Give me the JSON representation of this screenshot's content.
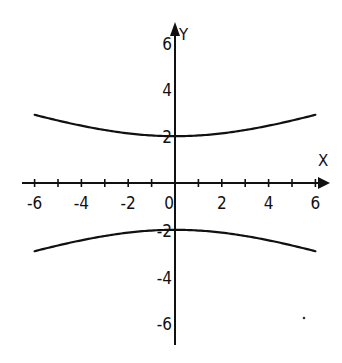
{
  "chart_data": {
    "type": "line",
    "title": "",
    "xlabel": "X",
    "ylabel": "Y",
    "xlim": [
      -6.5,
      6.5
    ],
    "ylim": [
      -7,
      7
    ],
    "grid": false,
    "legend": "none",
    "x_ticks": [
      -6,
      -5,
      -4,
      -3,
      -2,
      -1,
      1,
      2,
      3,
      4,
      5,
      6
    ],
    "x_tick_labels": [
      {
        "value": -6,
        "text": "-6"
      },
      {
        "value": -4,
        "text": "-4"
      },
      {
        "value": -2,
        "text": "-2"
      },
      {
        "value": 0,
        "text": "0"
      },
      {
        "value": 2,
        "text": "2"
      },
      {
        "value": 4,
        "text": "4"
      },
      {
        "value": 6,
        "text": "6"
      }
    ],
    "y_tick_labels": [
      {
        "value": 6,
        "text": "6"
      },
      {
        "value": 4,
        "text": "4"
      },
      {
        "value": 2,
        "text": "2"
      },
      {
        "value": -2,
        "text": "-2"
      },
      {
        "value": -4,
        "text": "-4"
      },
      {
        "value": -6,
        "text": "-6"
      }
    ],
    "series": [
      {
        "name": "upper-branch",
        "equation": "y = 2*sqrt(1 + x^2/32)",
        "x": [
          -6,
          -5,
          -4,
          -3,
          -2,
          -1,
          0,
          1,
          2,
          3,
          4,
          5,
          6
        ],
        "y": [
          2.92,
          2.66,
          2.45,
          2.27,
          2.12,
          2.03,
          2.0,
          2.03,
          2.12,
          2.27,
          2.45,
          2.66,
          2.92
        ]
      },
      {
        "name": "lower-branch",
        "equation": "y = -2*sqrt(1 + x^2/32)",
        "x": [
          -6,
          -5,
          -4,
          -3,
          -2,
          -1,
          0,
          1,
          2,
          3,
          4,
          5,
          6
        ],
        "y": [
          -2.92,
          -2.66,
          -2.45,
          -2.27,
          -2.12,
          -2.03,
          -2.0,
          -2.03,
          -2.12,
          -2.27,
          -2.45,
          -2.66,
          -2.92
        ]
      }
    ]
  }
}
